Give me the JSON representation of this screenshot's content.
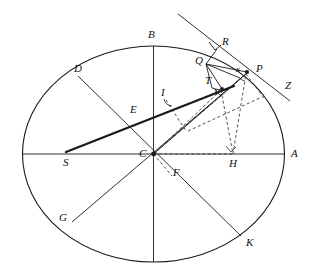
{
  "figure": {
    "type": "geometry-diagram",
    "title": "",
    "canvas": {
      "width": 314,
      "height": 279,
      "background": "#ffffff"
    },
    "stroke_colors": {
      "primary": "#1a1a1a",
      "dashed": "#333333"
    }
  },
  "labels": [
    {
      "id": "B",
      "text": "B",
      "x": 148,
      "y": 29,
      "note": "top of vertical diameter"
    },
    {
      "id": "R",
      "text": "R",
      "x": 222,
      "y": 36,
      "note": "on tangent line, above P"
    },
    {
      "id": "Q",
      "text": "Q",
      "x": 197,
      "y": 57,
      "note": "point on arc left of P"
    },
    {
      "id": "P",
      "text": "P",
      "x": 256,
      "y": 67,
      "note": "point on ellipse upper right"
    },
    {
      "id": "D",
      "text": "D",
      "x": 74,
      "y": 67,
      "note": "on ellipse upper left"
    },
    {
      "id": "x",
      "text": "x",
      "x": 237,
      "y": 73,
      "note": "small angle label near P",
      "small": true
    },
    {
      "id": "Z",
      "text": "Z",
      "x": 285,
      "y": 85,
      "note": "end of tangent line lower right"
    },
    {
      "id": "T",
      "text": "T",
      "x": 208,
      "y": 81,
      "note": "between Q and V"
    },
    {
      "id": "V",
      "text": "V",
      "x": 216,
      "y": 92,
      "note": "foot point on thick line",
      "small": true
    },
    {
      "id": "I",
      "text": "I",
      "x": 163,
      "y": 94,
      "note": "angle mark on thick line"
    },
    {
      "id": "E",
      "text": "E",
      "x": 132,
      "y": 111,
      "note": "intersection on D-K diameter"
    },
    {
      "id": "S",
      "text": "S",
      "x": 64,
      "y": 161,
      "note": "left end of thick chord on horizontal axis"
    },
    {
      "id": "C",
      "text": "C",
      "x": 140,
      "y": 156,
      "note": "center of ellipse"
    },
    {
      "id": "H",
      "text": "H",
      "x": 230,
      "y": 162,
      "note": "foot of perpendicular on horizontal axis"
    },
    {
      "id": "A",
      "text": "A",
      "x": 291,
      "y": 155,
      "note": "right end of horizontal diameter"
    },
    {
      "id": "F",
      "text": "F",
      "x": 174,
      "y": 174,
      "note": "below center"
    },
    {
      "id": "G",
      "text": "G",
      "x": 60,
      "y": 219,
      "note": "on ellipse lower left"
    },
    {
      "id": "K",
      "text": "K",
      "x": 247,
      "y": 243,
      "note": "on ellipse lower right"
    }
  ],
  "ellipse": {
    "cx": 153.5,
    "cy": 154,
    "rx": 131,
    "ry": 108
  },
  "points": {
    "A": {
      "x": 284.5,
      "y": 154
    },
    "S": {
      "x": 66,
      "y": 152
    },
    "B": {
      "x": 153.5,
      "y": 46
    },
    "C": {
      "x": 153.5,
      "y": 154
    },
    "D": {
      "x": 78,
      "y": 76
    },
    "K": {
      "x": 241,
      "y": 235
    },
    "G": {
      "x": 72,
      "y": 222
    },
    "P": {
      "x": 247,
      "y": 72
    },
    "Q": {
      "x": 205,
      "y": 63
    },
    "R": {
      "x": 216,
      "y": 48
    },
    "T": {
      "x": 216,
      "y": 88
    },
    "V": {
      "x": 219,
      "y": 88
    },
    "E": {
      "x": 139,
      "y": 118
    },
    "H": {
      "x": 233,
      "y": 154
    },
    "F": {
      "x": 170,
      "y": 169
    },
    "I": {
      "x": 166,
      "y": 101
    },
    "Z": {
      "x": 276,
      "y": 94
    }
  },
  "solid_lines": [
    {
      "name": "horizontal-diameter-S-A",
      "from": "left-edge",
      "to": "right-edge"
    },
    {
      "name": "vertical-diameter-B-bottom",
      "from": "top-edge",
      "to": "bottom-edge"
    },
    {
      "name": "diameter-D-K",
      "from": "D",
      "to": "K"
    },
    {
      "name": "diameter-G-P-side",
      "from": "G",
      "to": "upper-right"
    },
    {
      "name": "thick-chord-S-to-P",
      "from": "S",
      "to": "P-region",
      "weight": "thick"
    },
    {
      "name": "line-C-to-P",
      "from": "C",
      "to": "P"
    },
    {
      "name": "tangent-line-through-R-P-Z",
      "from": "upper-left",
      "to": "Z"
    },
    {
      "name": "segment-Q-R",
      "from": "Q",
      "to": "R"
    },
    {
      "name": "segment-Q-P",
      "from": "Q",
      "to": "P"
    },
    {
      "name": "segment-Q-V",
      "from": "Q",
      "to": "V"
    },
    {
      "name": "segment-Q-T",
      "from": "Q",
      "to": "T"
    }
  ],
  "dashed_lines": [
    {
      "name": "dashed-C-to-H",
      "from": "C",
      "to": "H"
    },
    {
      "name": "dashed-H-to-P",
      "from": "H",
      "to": "P"
    },
    {
      "name": "dashed-C-to-P-parallelogram",
      "from": "C",
      "to": "P"
    },
    {
      "name": "dashed-P-to-Z-region",
      "from": "P",
      "to": "Z"
    },
    {
      "name": "dashed-V-to-H",
      "from": "V",
      "to": "H"
    },
    {
      "name": "dashed-C-to-F",
      "from": "C",
      "to": "F"
    }
  ],
  "right_angle_marks": [
    {
      "name": "right-angle-at-R",
      "x": 213,
      "y": 45
    },
    {
      "name": "right-angle-at-H",
      "x": 228,
      "y": 148
    },
    {
      "name": "angle-mark-at-I",
      "x": 166,
      "y": 100
    }
  ]
}
